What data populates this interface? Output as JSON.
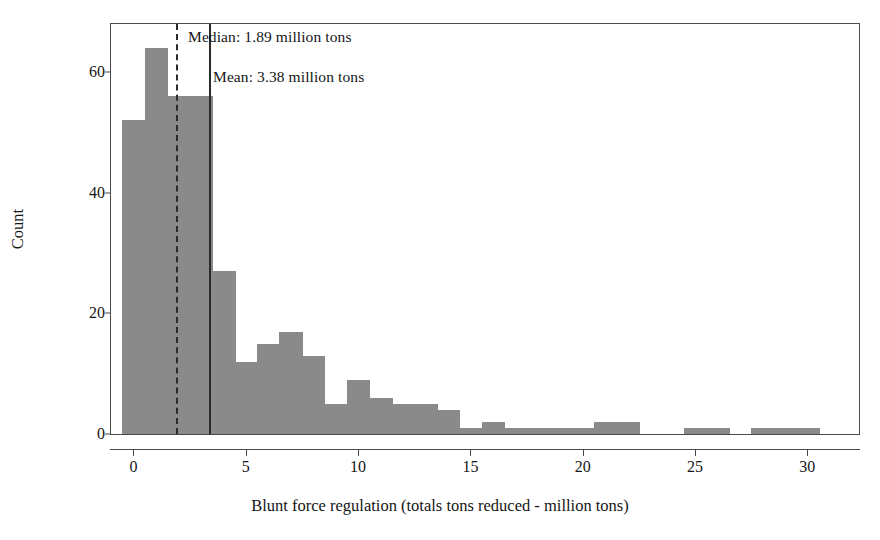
{
  "chart_data": {
    "type": "bar",
    "title": "",
    "subtitle": "",
    "xlabel": "Blunt force regulation (totals tons reduced - million tons)",
    "ylabel": "Count",
    "xlim": [
      -1.0,
      32.3
    ],
    "ylim": [
      0,
      68
    ],
    "grid": false,
    "legend": null,
    "bin_width": 1.0,
    "bar_color": "#8a8a8a",
    "axis_color": "#4a4a4a",
    "xticks": [
      0,
      5,
      10,
      15,
      20,
      25,
      30
    ],
    "xtick_labels": [
      "0",
      "5",
      "10",
      "15",
      "20",
      "25",
      "30"
    ],
    "yticks": [
      0,
      20,
      40,
      60
    ],
    "ytick_labels": [
      "0",
      "20",
      "40",
      "60"
    ],
    "bins": [
      {
        "left": -0.5,
        "right": 0.5,
        "count": 52
      },
      {
        "left": 0.5,
        "right": 1.5,
        "count": 64
      },
      {
        "left": 1.5,
        "right": 2.5,
        "count": 56
      },
      {
        "left": 2.5,
        "right": 3.5,
        "count": 56
      },
      {
        "left": 3.5,
        "right": 4.5,
        "count": 27
      },
      {
        "left": 4.5,
        "right": 5.5,
        "count": 12
      },
      {
        "left": 5.5,
        "right": 6.5,
        "count": 15
      },
      {
        "left": 6.5,
        "right": 7.5,
        "count": 17
      },
      {
        "left": 7.5,
        "right": 8.5,
        "count": 13
      },
      {
        "left": 8.5,
        "right": 9.5,
        "count": 5
      },
      {
        "left": 9.5,
        "right": 10.5,
        "count": 9
      },
      {
        "left": 10.5,
        "right": 11.5,
        "count": 6
      },
      {
        "left": 11.5,
        "right": 12.5,
        "count": 5
      },
      {
        "left": 12.5,
        "right": 13.5,
        "count": 5
      },
      {
        "left": 13.5,
        "right": 14.5,
        "count": 4
      },
      {
        "left": 14.5,
        "right": 15.5,
        "count": 1
      },
      {
        "left": 15.5,
        "right": 16.5,
        "count": 2
      },
      {
        "left": 16.5,
        "right": 17.5,
        "count": 1
      },
      {
        "left": 17.5,
        "right": 18.5,
        "count": 1
      },
      {
        "left": 18.5,
        "right": 19.5,
        "count": 1
      },
      {
        "left": 19.5,
        "right": 20.5,
        "count": 1
      },
      {
        "left": 20.5,
        "right": 21.5,
        "count": 2
      },
      {
        "left": 21.5,
        "right": 22.5,
        "count": 2
      },
      {
        "left": 24.5,
        "right": 25.5,
        "count": 1
      },
      {
        "left": 25.5,
        "right": 26.5,
        "count": 1
      },
      {
        "left": 27.5,
        "right": 28.5,
        "count": 1
      },
      {
        "left": 28.5,
        "right": 29.5,
        "count": 1
      },
      {
        "left": 29.5,
        "right": 30.5,
        "count": 1
      }
    ],
    "reference_lines": [
      {
        "id": "median",
        "value": 1.89,
        "style": "dashed",
        "label": "Median: 1.89 million tons"
      },
      {
        "id": "mean",
        "value": 3.38,
        "style": "solid",
        "label": "Mean: 3.38 million tons"
      }
    ]
  }
}
